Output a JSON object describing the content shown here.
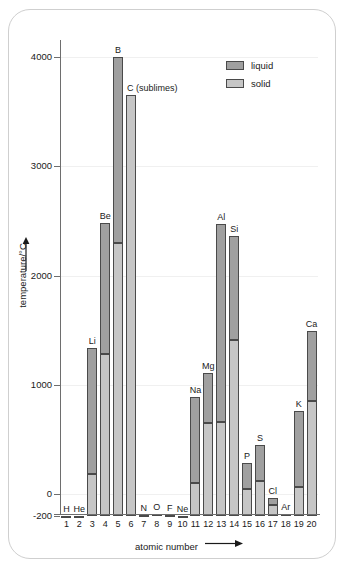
{
  "chart_data": {
    "type": "bar",
    "title": "",
    "subtitle": "",
    "xlabel": "atomic number",
    "ylabel": "temperature/°C",
    "ylim": [
      -260,
      4350
    ],
    "yticks": [
      -200,
      0,
      1000,
      2000,
      3000,
      4000
    ],
    "ytick_labels": [
      "-200",
      "0",
      "1000",
      "2000",
      "3000",
      "4000"
    ],
    "grid": true,
    "grid_axis": "y",
    "legend_position": "top-right",
    "baseline": -200,
    "x": [
      1,
      2,
      3,
      4,
      5,
      6,
      7,
      8,
      9,
      10,
      11,
      12,
      13,
      14,
      15,
      16,
      17,
      18,
      19,
      20
    ],
    "xtick_labels": [
      "1",
      "2",
      "3",
      "4",
      "5",
      "6",
      "7",
      "8",
      "9",
      "10",
      "11",
      "12",
      "13",
      "14",
      "15",
      "16",
      "17",
      "18",
      "19",
      "20"
    ],
    "series": [
      {
        "name": "solid",
        "color": "#c6c6c6",
        "description": "bar from baseline up to the melting point"
      },
      {
        "name": "liquid",
        "color": "#a0a0a0",
        "description": "bar from melting point up to the boiling point"
      }
    ],
    "elements": [
      {
        "z": 1,
        "symbol": "H",
        "label": "H",
        "melting": -259,
        "boiling": -253,
        "note": ""
      },
      {
        "z": 2,
        "symbol": "He",
        "label": "He",
        "melting": -272,
        "boiling": -269,
        "note": ""
      },
      {
        "z": 3,
        "symbol": "Li",
        "label": "Li",
        "melting": 180,
        "boiling": 1340,
        "note": ""
      },
      {
        "z": 4,
        "symbol": "Be",
        "label": "Be",
        "melting": 1280,
        "boiling": 2480,
        "note": ""
      },
      {
        "z": 5,
        "symbol": "B",
        "label": "B",
        "melting": 2300,
        "boiling": 4000,
        "note": ""
      },
      {
        "z": 6,
        "symbol": "C",
        "label": "C (sublimes)",
        "melting": 3650,
        "boiling": 3650,
        "note": "sublimes"
      },
      {
        "z": 7,
        "symbol": "N",
        "label": "N",
        "melting": -210,
        "boiling": -196,
        "note": ""
      },
      {
        "z": 8,
        "symbol": "O",
        "label": "O",
        "melting": -219,
        "boiling": -183,
        "note": ""
      },
      {
        "z": 9,
        "symbol": "F",
        "label": "F",
        "melting": -220,
        "boiling": -188,
        "note": ""
      },
      {
        "z": 10,
        "symbol": "Ne",
        "label": "Ne",
        "melting": -249,
        "boiling": -246,
        "note": ""
      },
      {
        "z": 11,
        "symbol": "Na",
        "label": "Na",
        "melting": 98,
        "boiling": 890,
        "note": ""
      },
      {
        "z": 12,
        "symbol": "Mg",
        "label": "Mg",
        "melting": 650,
        "boiling": 1110,
        "note": ""
      },
      {
        "z": 13,
        "symbol": "Al",
        "label": "Al",
        "melting": 660,
        "boiling": 2470,
        "note": ""
      },
      {
        "z": 14,
        "symbol": "Si",
        "label": "Si",
        "melting": 1410,
        "boiling": 2360,
        "note": ""
      },
      {
        "z": 15,
        "symbol": "P",
        "label": "P",
        "melting": 44,
        "boiling": 280,
        "note": ""
      },
      {
        "z": 16,
        "symbol": "S",
        "label": "S",
        "melting": 119,
        "boiling": 445,
        "note": ""
      },
      {
        "z": 17,
        "symbol": "Cl",
        "label": "Cl",
        "melting": -101,
        "boiling": -35,
        "note": ""
      },
      {
        "z": 18,
        "symbol": "Ar",
        "label": "Ar",
        "melting": -189,
        "boiling": -186,
        "note": ""
      },
      {
        "z": 19,
        "symbol": "K",
        "label": "K",
        "melting": 63,
        "boiling": 760,
        "note": ""
      },
      {
        "z": 20,
        "symbol": "Ca",
        "label": "Ca",
        "melting": 850,
        "boiling": 1490,
        "note": ""
      }
    ]
  },
  "legend": {
    "items": [
      {
        "key": "liquid",
        "label": "liquid",
        "color": "#a0a0a0"
      },
      {
        "key": "solid",
        "label": "solid",
        "color": "#c6c6c6"
      }
    ]
  },
  "axes": {
    "x_title": "atomic number",
    "y_title": "temperature/°C",
    "x_arrow_glyph": "⟶",
    "y_arrow_glyph": "⟶"
  }
}
